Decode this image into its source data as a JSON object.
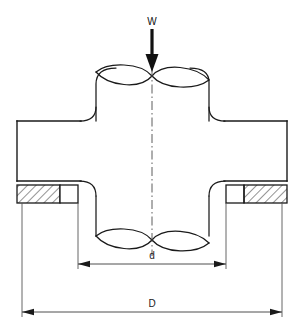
{
  "figure": {
    "kind": "engineering-cross-section-drawing",
    "background_color": "#ffffff",
    "line_color": "#1a1a1a",
    "hatch_color": "#2a2a2a"
  },
  "labels": {
    "load": "W",
    "inner_diameter": "d",
    "outer_diameter": "D"
  },
  "annotations": {
    "load_arrow": {
      "name": "load-arrow",
      "direction": "down",
      "x": 152,
      "tail_y": 29,
      "head_y": 70
    },
    "centerline": {
      "name": "vertical-centerline",
      "x": 152,
      "top_y": 68,
      "bottom_y": 255,
      "style": "dash-dot"
    }
  },
  "dimensions": [
    {
      "name": "inner-diameter-dimension",
      "label": "d",
      "x_start": 78,
      "x_end": 226,
      "y": 264,
      "label_x": 152,
      "label_y": 258,
      "extension_top": 203,
      "arrows": "both"
    },
    {
      "name": "outer-diameter-dimension",
      "label": "D",
      "x_start": 22,
      "x_end": 282,
      "y": 312,
      "label_x": 152,
      "label_y": 306,
      "extension_top": 203,
      "arrows": "both"
    }
  ],
  "geometry": {
    "plate": {
      "name": "flange-plate",
      "left": 17,
      "right": 287,
      "top": 121,
      "bottom": 181
    },
    "hatch_bands": [
      {
        "name": "left-hatched-section",
        "left": 17,
        "right": 78,
        "top": 185,
        "bottom": 203,
        "gap_right": 18
      },
      {
        "name": "right-hatched-section",
        "left": 226,
        "right": 287,
        "top": 185,
        "bottom": 203,
        "gap_left": 18
      }
    ],
    "shaft": {
      "name": "cylindrical-shaft",
      "left": 96,
      "right": 209,
      "top_y": 68,
      "bottom_y": 255,
      "ellipse_ry": 14,
      "fillet_radius": 14
    }
  }
}
